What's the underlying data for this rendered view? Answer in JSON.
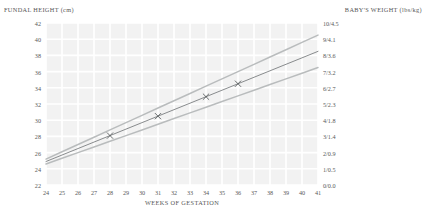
{
  "header": {
    "left_title": "FUNDAL HEIGHT (cm)",
    "right_title": "BABY'S WEIGHT (lbs/kg)"
  },
  "chart_data": {
    "type": "line",
    "title": "",
    "xlabel": "WEEKS OF GESTATION",
    "ylabel": "FUNDAL HEIGHT (cm)",
    "y2label": "BABY'S WEIGHT (lbs/kg)",
    "xlim": [
      24,
      41
    ],
    "ylim": [
      22,
      42
    ],
    "y2lim": [
      0,
      10
    ],
    "grid": true,
    "legend": "none",
    "x_ticks": [
      24,
      25,
      26,
      27,
      28,
      29,
      30,
      31,
      32,
      33,
      34,
      35,
      36,
      37,
      38,
      39,
      40,
      41
    ],
    "y_ticks": [
      22,
      24,
      26,
      28,
      30,
      32,
      34,
      36,
      38,
      40,
      42
    ],
    "y2_ticks": [
      "0/0.0",
      "1/0.5",
      "2/0.9",
      "3/1.4",
      "4/1.8",
      "5/2.3",
      "6/2.7",
      "7/3.2",
      "8/3.6",
      "9/4.1",
      "10/4.5"
    ],
    "x": [
      24,
      25,
      26,
      27,
      28,
      29,
      30,
      31,
      32,
      33,
      34,
      35,
      36,
      37,
      38,
      39,
      40,
      41
    ],
    "series": [
      {
        "name": "upper-bound",
        "color": "#b9bcbd",
        "values": [
          25.2,
          26.1,
          27.0,
          27.9,
          28.8,
          29.7,
          30.6,
          31.5,
          32.4,
          33.3,
          34.2,
          35.1,
          36.0,
          36.9,
          37.8,
          38.7,
          39.6,
          40.5
        ]
      },
      {
        "name": "median",
        "color": "#7c7f81",
        "values": [
          24.9,
          25.7,
          26.5,
          27.3,
          28.1,
          28.9,
          29.7,
          30.5,
          31.3,
          32.1,
          32.9,
          33.7,
          34.5,
          35.3,
          36.1,
          36.9,
          37.7,
          38.5
        ]
      },
      {
        "name": "lower-bound",
        "color": "#b9bcbd",
        "values": [
          24.6,
          25.3,
          26.0,
          26.7,
          27.4,
          28.1,
          28.8,
          29.5,
          30.2,
          30.9,
          31.6,
          32.3,
          33.0,
          33.7,
          34.4,
          35.1,
          35.8,
          36.5
        ]
      }
    ],
    "measurements": {
      "name": "fundal-height-measurements",
      "marker": "x",
      "color": "#54585a",
      "points": [
        {
          "x": 28,
          "y": 28.1
        },
        {
          "x": 31,
          "y": 30.5
        },
        {
          "x": 34,
          "y": 32.9
        },
        {
          "x": 36,
          "y": 34.5
        }
      ]
    }
  }
}
